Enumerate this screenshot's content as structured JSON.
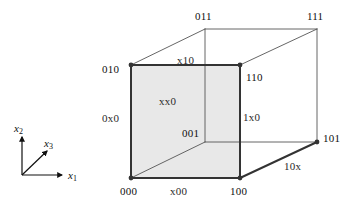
{
  "figure": {
    "type": "3-cube boolean lattice diagram",
    "colors": {
      "face_fill": "#e8e8e8",
      "edge_bold": "#333333",
      "edge_thin": "#555555",
      "vertex_dot": "#333333",
      "text": "#1a1a1a",
      "background": "#ffffff"
    },
    "axes": {
      "origin": {
        "x": 22,
        "y": 175
      },
      "items": [
        {
          "name": "x2",
          "base": "x",
          "sub": "2",
          "label_x": 14,
          "label_y": 123,
          "tip_x": 22,
          "tip_y": 137
        },
        {
          "name": "x3",
          "base": "x",
          "sub": "3",
          "label_x": 44,
          "label_y": 138,
          "tip_x": 47,
          "tip_y": 151
        },
        {
          "name": "x1",
          "base": "x",
          "sub": "1",
          "label_x": 68,
          "label_y": 170,
          "tip_x": 62,
          "tip_y": 175
        }
      ]
    },
    "vertices": [
      {
        "code": "010",
        "x": 131,
        "y": 65,
        "label_x": 102,
        "label_y": 64,
        "dot": true,
        "bold": true
      },
      {
        "code": "110",
        "x": 240,
        "y": 65,
        "label_x": 246,
        "label_y": 72,
        "dot": true,
        "bold": true
      },
      {
        "code": "000",
        "x": 131,
        "y": 178,
        "label_x": 120,
        "label_y": 186,
        "dot": true,
        "bold": true
      },
      {
        "code": "100",
        "x": 240,
        "y": 178,
        "label_x": 230,
        "label_y": 186,
        "dot": true,
        "bold": true
      },
      {
        "code": "011",
        "x": 205,
        "y": 29,
        "label_x": 195,
        "label_y": 11,
        "dot": false,
        "bold": false
      },
      {
        "code": "111",
        "x": 317,
        "y": 29,
        "label_x": 307,
        "label_y": 11,
        "dot": false,
        "bold": false
      },
      {
        "code": "001",
        "x": 240,
        "y": 142,
        "label_x": 182,
        "label_y": 128,
        "dot": false,
        "bold": false
      },
      {
        "code": "101",
        "x": 317,
        "y": 142,
        "label_x": 323,
        "label_y": 133,
        "dot": true,
        "bold": false
      }
    ],
    "face_labels": [
      {
        "code": "xx0",
        "x": 159,
        "y": 96
      },
      {
        "code": "0x0",
        "x": 102,
        "y": 113
      },
      {
        "code": "1x0",
        "x": 243,
        "y": 112
      },
      {
        "code": "x10",
        "x": 177,
        "y": 55
      },
      {
        "code": "x00",
        "x": 170,
        "y": 186
      },
      {
        "code": "10x",
        "x": 284,
        "y": 161
      }
    ],
    "front_face": {
      "name": "xx0",
      "points": "131,65 240,65 240,178 131,178",
      "fill": "#e8e8e8"
    },
    "edges_bold": [
      {
        "name": "edge-010-110",
        "x1": 131,
        "y1": 65,
        "x2": 240,
        "y2": 65
      },
      {
        "name": "edge-010-000",
        "x1": 131,
        "y1": 65,
        "x2": 131,
        "y2": 178
      },
      {
        "name": "edge-000-100",
        "x1": 131,
        "y1": 178,
        "x2": 240,
        "y2": 178
      },
      {
        "name": "edge-110-100",
        "x1": 240,
        "y1": 65,
        "x2": 240,
        "y2": 178
      },
      {
        "name": "edge-100-101",
        "x1": 240,
        "y1": 178,
        "x2": 317,
        "y2": 142
      }
    ],
    "edges_thin": [
      {
        "name": "edge-011-111",
        "x1": 205,
        "y1": 29,
        "x2": 317,
        "y2": 29
      },
      {
        "name": "edge-011-001",
        "x1": 205,
        "y1": 29,
        "x2": 205,
        "y2": 142
      },
      {
        "name": "edge-001-101",
        "x1": 205,
        "y1": 142,
        "x2": 317,
        "y2": 142
      },
      {
        "name": "edge-111-101",
        "x1": 317,
        "y1": 29,
        "x2": 317,
        "y2": 142
      },
      {
        "name": "edge-010-011",
        "x1": 131,
        "y1": 65,
        "x2": 205,
        "y2": 29
      },
      {
        "name": "edge-110-111",
        "x1": 240,
        "y1": 65,
        "x2": 317,
        "y2": 29
      },
      {
        "name": "edge-000-001",
        "x1": 131,
        "y1": 178,
        "x2": 205,
        "y2": 142
      }
    ]
  }
}
